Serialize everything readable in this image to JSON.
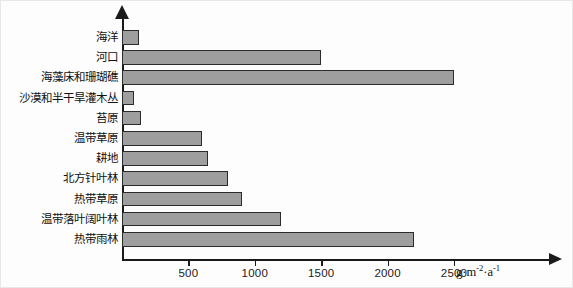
{
  "chart_data": {
    "type": "bar",
    "orientation": "horizontal",
    "title": "",
    "xlabel": "g·m⁻²·a⁻¹",
    "ylabel": "",
    "xlim": [
      0,
      2700
    ],
    "grid": false,
    "legend": null,
    "categories": [
      "海洋",
      "河口",
      "海藻床和珊瑚礁",
      "沙漠和半干旱灌木丛",
      "苔原",
      "温带草原",
      "耕地",
      "北方针叶林",
      "热带草原",
      "温带落叶阔叶林",
      "热带雨林"
    ],
    "values": [
      125,
      1500,
      2500,
      90,
      140,
      600,
      650,
      800,
      900,
      1200,
      2200
    ],
    "tick_values": [
      500,
      1000,
      1500,
      2000,
      2500
    ],
    "tick_labels": [
      "500",
      "1000",
      "1500",
      "2000",
      "2500"
    ],
    "bar_color": "#9e9e9e",
    "bar_edge_color": "#2b2b2b",
    "axis_color": "#1a1a1a"
  },
  "unit": {
    "base": "g",
    "dot1": "·",
    "m": "m",
    "m_exp": "-2",
    "dot2": "·",
    "a": "a",
    "a_exp": "-1"
  }
}
